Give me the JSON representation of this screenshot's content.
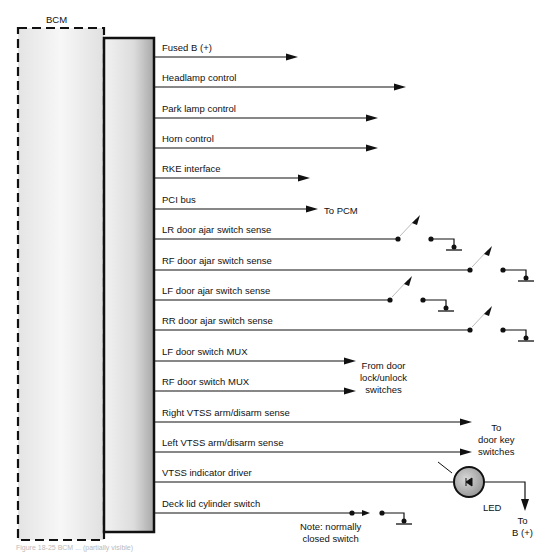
{
  "module": {
    "label": "BCM"
  },
  "signals": [
    {
      "label": "Fused B (+)",
      "y": 57,
      "end": 298,
      "type": "arrow"
    },
    {
      "label": "Headlamp control",
      "y": 87,
      "end": 406,
      "type": "arrow"
    },
    {
      "label": "Park lamp control",
      "y": 118,
      "end": 378,
      "type": "arrow"
    },
    {
      "label": "Horn control",
      "y": 148,
      "end": 378,
      "type": "arrow"
    },
    {
      "label": "RKE interface",
      "y": 178,
      "end": 310,
      "type": "arrow"
    },
    {
      "label": "PCI bus",
      "y": 209,
      "end": 318,
      "type": "arrow"
    },
    {
      "label": "LR door ajar switch sense",
      "y": 239,
      "end": 398,
      "type": "switch"
    },
    {
      "label": "RF door ajar switch sense",
      "y": 270,
      "end": 470,
      "type": "switch"
    },
    {
      "label": "LF door ajar switch sense",
      "y": 300,
      "end": 390,
      "type": "switch"
    },
    {
      "label": "RR door ajar switch sense",
      "y": 330,
      "end": 470,
      "type": "switch"
    },
    {
      "label": "LF door switch MUX",
      "y": 361,
      "end": 356,
      "type": "arrow"
    },
    {
      "label": "RF door switch MUX",
      "y": 391,
      "end": 356,
      "type": "arrow"
    },
    {
      "label": "Right VTSS arm/disarm sense",
      "y": 422,
      "end": 472,
      "type": "arrow"
    },
    {
      "label": "Left VTSS arm/disarm sense",
      "y": 452,
      "end": 472,
      "type": "arrow"
    },
    {
      "label": "VTSS indicator driver",
      "y": 482,
      "end": 453,
      "type": "led"
    },
    {
      "label": "Deck lid cylinder switch",
      "y": 513,
      "end": 462,
      "type": "nc-switch"
    }
  ],
  "annotations": {
    "to_pcm": "To PCM",
    "from_door_lock": "From door\nlock/unlock\nswitches",
    "to_door_key": "To\ndoor key\nswitches",
    "led": "LED",
    "to_b_plus": "To\nB (+)",
    "note_nc": "Note: normally\nclosed switch"
  },
  "caption": "Figure 18-25 BCM ... (partially visible)"
}
